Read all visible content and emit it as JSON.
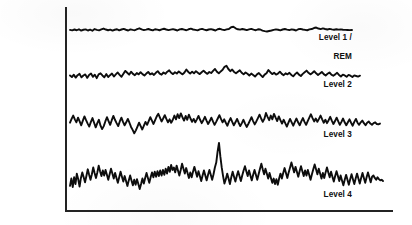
{
  "figure": {
    "background_color": "#ffffff",
    "trace_color": "#0d0d0d",
    "axis_color": "#232323",
    "label_color": "#101010"
  },
  "axis": {
    "vertical": {
      "x": 66,
      "y_top": 8,
      "y_bottom": 211
    },
    "horizontal": {
      "y": 211,
      "x_left": 66,
      "x_right": 392
    }
  },
  "labels": [
    {
      "name": "level-1-rem",
      "line1": "Level 1 /",
      "line2": "REM",
      "right": 352,
      "top": 24
    },
    {
      "name": "level-2",
      "line1": "Level 2",
      "line2": "",
      "right": 352,
      "top": 71
    },
    {
      "name": "level-3",
      "line1": "Level 3",
      "line2": "",
      "right": 352,
      "top": 121
    },
    {
      "name": "level-4",
      "line1": "Level 4",
      "line2": "",
      "right": 352,
      "top": 181
    }
  ],
  "chart_data": {
    "type": "line",
    "xlabel": "",
    "ylabel": "",
    "grid": false,
    "legend": "left-outside-labels",
    "x_axis_range": [
      66,
      392
    ],
    "series": [
      {
        "name": "Level 1 / REM",
        "baseline_y": 30,
        "amplitude": 3.2,
        "x_start": 70,
        "x_end": 352,
        "values": [
          0.1,
          -0.3,
          0.4,
          -0.2,
          0.6,
          -0.5,
          0.2,
          0.5,
          -0.4,
          0.3,
          -0.6,
          0.8,
          0.1,
          -0.3,
          0.5,
          1.2,
          0.4,
          -0.2,
          0.3,
          -0.5,
          0.2,
          0.6,
          -0.3,
          0.4,
          0.9,
          0.2,
          -0.4,
          0.5,
          0.1,
          -0.2,
          0.7,
          1.4,
          0.5,
          -0.1,
          0.3,
          0.8,
          0.2,
          -0.3,
          0.6,
          0.3,
          -0.2,
          0.5,
          1.0,
          0.4,
          -0.1,
          0.3,
          0.7,
          0.2,
          -0.4,
          0.5,
          0.8,
          0.3,
          -0.2,
          0.6,
          1.1,
          0.4,
          0.1,
          -0.3,
          0.5,
          0.9,
          0.3,
          -0.2,
          0.4,
          0.7,
          0.2,
          -0.4,
          0.6,
          1.0,
          0.3,
          -0.1,
          0.5,
          0.8,
          2.2,
          2.6,
          1.4,
          0.6,
          0.3,
          0.8,
          0.4,
          -0.1,
          0.5,
          0.9,
          0.3,
          -0.2,
          0.6,
          0.4,
          -0.5,
          -0.9,
          -1.2,
          -0.8,
          -0.4,
          0.1,
          0.5,
          0.2,
          -0.3,
          0.4,
          0.8,
          0.3,
          -0.1,
          0.5,
          0.2,
          -0.4,
          0.6,
          0.9,
          0.4,
          0.1,
          -0.2,
          0.5,
          0.8,
          1.6,
          2.0,
          1.2,
          0.7,
          1.3,
          0.8,
          0.4,
          0.9,
          0.5,
          0.2,
          0.6,
          0.3,
          0.5,
          0.2,
          0.1,
          0.0,
          -0.1,
          0.0
        ]
      },
      {
        "name": "Level 2",
        "baseline_y": 76,
        "amplitude": 7.0,
        "x_start": 70,
        "x_end": 360,
        "values": [
          0.2,
          -0.4,
          0.5,
          -0.6,
          0.3,
          0.8,
          -0.5,
          0.2,
          0.6,
          -0.7,
          0.4,
          0.9,
          -0.3,
          0.5,
          -0.8,
          0.6,
          1.0,
          0.2,
          -0.5,
          0.7,
          -0.4,
          0.3,
          0.9,
          -0.2,
          0.6,
          1.3,
          0.4,
          -0.3,
          0.8,
          1.9,
          1.2,
          0.5,
          1.6,
          0.8,
          0.3,
          1.1,
          0.6,
          1.4,
          0.7,
          0.2,
          0.9,
          1.5,
          0.6,
          1.0,
          0.4,
          1.2,
          1.8,
          0.9,
          0.5,
          1.3,
          0.8,
          1.6,
          2.1,
          1.2,
          0.7,
          1.4,
          0.9,
          1.7,
          1.1,
          0.6,
          1.3,
          2.4,
          1.5,
          0.9,
          1.6,
          1.0,
          1.8,
          1.2,
          0.7,
          1.4,
          2.0,
          1.3,
          0.8,
          1.5,
          1.1,
          1.9,
          2.6,
          1.6,
          1.0,
          1.7,
          2.3,
          3.4,
          3.8,
          2.6,
          1.8,
          2.4,
          1.5,
          1.0,
          1.6,
          2.1,
          1.2,
          0.6,
          1.3,
          0.8,
          0.2,
          0.9,
          0.4,
          -0.2,
          0.6,
          1.1,
          0.3,
          -0.4,
          0.5,
          1.0,
          2.2,
          1.4,
          0.7,
          1.2,
          0.5,
          0.9,
          1.6,
          0.8,
          0.3,
          1.0,
          0.6,
          1.2,
          0.4,
          -0.1,
          0.7,
          1.3,
          0.5,
          0.0,
          0.8,
          1.4,
          2.0,
          1.2,
          0.6,
          1.1,
          1.8,
          1.0,
          0.4,
          0.9,
          1.5,
          0.7,
          0.2,
          0.8,
          1.3,
          0.5,
          0.1,
          0.6,
          1.2,
          0.4,
          -0.2,
          0.5,
          0.2,
          -0.3,
          0.4,
          0.1,
          -0.4,
          0.2,
          0.0,
          -0.2,
          0.1
        ]
      },
      {
        "name": "Level 3",
        "baseline_y": 124,
        "amplitude": 11.0,
        "x_start": 70,
        "x_end": 380,
        "values": [
          0.3,
          1.2,
          2.0,
          1.1,
          0.4,
          1.5,
          0.6,
          -0.3,
          0.8,
          1.8,
          0.9,
          0.1,
          -0.6,
          0.5,
          1.4,
          0.3,
          -0.8,
          0.2,
          1.0,
          -0.4,
          -1.2,
          -0.5,
          0.6,
          1.6,
          0.7,
          -0.2,
          0.9,
          1.9,
          1.0,
          0.2,
          -0.5,
          0.6,
          1.5,
          0.5,
          -0.3,
          0.4,
          1.2,
          0.3,
          -0.7,
          -1.4,
          -2.2,
          -1.5,
          -0.6,
          0.3,
          -0.5,
          -1.3,
          -0.4,
          0.5,
          -0.2,
          0.7,
          1.6,
          0.8,
          0.0,
          0.9,
          1.8,
          2.4,
          1.5,
          0.6,
          1.3,
          2.1,
          1.2,
          0.4,
          1.1,
          0.3,
          1.0,
          2.0,
          1.1,
          2.3,
          1.4,
          2.5,
          1.6,
          0.8,
          1.9,
          1.0,
          2.2,
          1.3,
          0.5,
          1.2,
          0.4,
          1.1,
          1.9,
          1.0,
          0.2,
          0.9,
          1.7,
          0.8,
          0.0,
          0.7,
          1.5,
          0.6,
          -0.2,
          0.5,
          1.3,
          2.1,
          1.2,
          0.4,
          1.1,
          0.3,
          -0.4,
          0.6,
          1.4,
          0.5,
          -0.3,
          0.4,
          1.2,
          0.3,
          -0.5,
          0.2,
          1.0,
          0.1,
          -0.7,
          0.0,
          0.8,
          1.6,
          0.7,
          -0.1,
          0.6,
          1.4,
          2.2,
          1.3,
          0.5,
          1.2,
          2.6,
          1.7,
          0.9,
          2.0,
          1.1,
          2.4,
          1.5,
          0.7,
          1.8,
          0.9,
          0.1,
          1.0,
          0.2,
          -0.6,
          0.3,
          1.2,
          0.4,
          -0.4,
          0.5,
          1.3,
          0.4,
          -0.3,
          0.6,
          1.4,
          0.5,
          -0.2,
          0.7,
          1.5,
          2.3,
          1.4,
          0.6,
          1.3,
          0.5,
          1.2,
          2.0,
          1.1,
          0.3,
          1.0,
          0.2,
          0.9,
          1.7,
          0.8,
          0.0,
          0.7,
          1.5,
          0.6,
          -0.2,
          0.5,
          1.3,
          0.4,
          -0.3,
          0.4,
          1.1,
          0.3,
          -0.4,
          0.5,
          1.2,
          0.3,
          -0.2,
          0.4,
          0.8,
          0.2,
          -0.3,
          0.3,
          0.6,
          0.1,
          -0.2,
          0.2,
          0.4,
          0.0,
          -0.1,
          0.1
        ]
      },
      {
        "name": "Level 4",
        "baseline_y": 181,
        "amplitude": 16.0,
        "x_start": 70,
        "x_end": 383,
        "values": [
          -0.8,
          0.4,
          -1.0,
          0.6,
          -0.5,
          1.2,
          0.3,
          -0.9,
          0.5,
          1.4,
          0.6,
          -0.2,
          0.8,
          1.9,
          1.0,
          0.2,
          1.1,
          2.2,
          1.3,
          0.5,
          1.4,
          2.5,
          1.6,
          0.8,
          1.7,
          0.9,
          1.8,
          1.0,
          0.2,
          1.1,
          2.0,
          1.2,
          0.4,
          1.3,
          0.5,
          -0.3,
          0.6,
          1.5,
          0.7,
          -0.1,
          0.8,
          0.0,
          -0.8,
          0.1,
          0.9,
          0.1,
          -0.7,
          0.2,
          -0.6,
          0.3,
          -0.5,
          -1.3,
          -0.5,
          0.4,
          -0.4,
          0.5,
          1.3,
          0.5,
          -0.3,
          0.6,
          1.4,
          0.6,
          1.5,
          0.7,
          1.6,
          0.8,
          1.7,
          0.9,
          1.8,
          1.0,
          2.0,
          1.2,
          2.3,
          1.5,
          2.6,
          1.8,
          2.2,
          1.4,
          2.5,
          1.7,
          0.9,
          1.8,
          2.8,
          2.0,
          1.2,
          2.1,
          1.3,
          0.5,
          1.4,
          0.6,
          1.5,
          2.3,
          1.5,
          0.7,
          1.6,
          0.8,
          0.0,
          0.9,
          1.7,
          0.9,
          0.1,
          1.0,
          1.8,
          1.0,
          0.2,
          1.1,
          2.2,
          3.0,
          4.8,
          6.2,
          4.0,
          2.2,
          0.8,
          -0.4,
          0.3,
          1.2,
          0.4,
          -0.5,
          0.6,
          1.5,
          0.7,
          -0.1,
          0.8,
          1.6,
          0.8,
          0.0,
          0.9,
          1.7,
          2.4,
          1.6,
          0.8,
          1.7,
          0.9,
          0.1,
          1.0,
          1.8,
          1.0,
          0.2,
          1.1,
          2.0,
          2.8,
          1.9,
          1.1,
          2.0,
          1.2,
          0.4,
          1.3,
          0.5,
          -0.3,
          0.4,
          -0.5,
          0.3,
          -0.6,
          0.4,
          1.2,
          0.4,
          1.3,
          2.1,
          1.3,
          0.5,
          1.4,
          2.2,
          3.0,
          2.2,
          1.4,
          2.3,
          1.5,
          0.7,
          1.6,
          2.4,
          1.6,
          0.8,
          1.7,
          0.9,
          1.8,
          1.0,
          0.2,
          1.1,
          1.9,
          2.7,
          1.9,
          1.1,
          2.0,
          1.2,
          0.4,
          1.3,
          0.5,
          1.4,
          2.2,
          1.4,
          0.6,
          1.5,
          0.7,
          -0.1,
          0.8,
          1.6,
          0.8,
          0.0,
          0.9,
          0.1,
          -0.7,
          0.2,
          1.0,
          0.2,
          -0.6,
          0.3,
          1.1,
          0.3,
          -0.5,
          0.4,
          1.2,
          0.4,
          -0.4,
          0.5,
          1.3,
          0.5,
          -0.3,
          0.6,
          1.4,
          0.6,
          -0.2,
          0.7,
          0.9,
          0.5,
          0.2,
          0.6,
          0.3,
          0.1,
          0.2,
          0.0
        ]
      }
    ]
  }
}
